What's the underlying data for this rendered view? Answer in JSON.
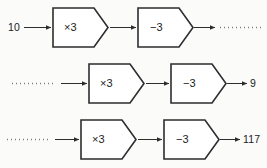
{
  "diagram": {
    "type": "flow-diagram",
    "background_color": "#fbfbfa",
    "shape_stroke_color": "#2d2d2d",
    "shape_fill_color": "#ffffff",
    "arrow_color": "#2d2d2d",
    "dotted_color": "#7d7d7d",
    "text_color": "#1b1b1b",
    "rows": [
      {
        "id": "row-1",
        "input": {
          "kind": "value",
          "text": "10"
        },
        "operations": [
          {
            "id": "op-multiply",
            "label": "×3"
          },
          {
            "id": "op-subtract",
            "label": "−3"
          }
        ],
        "output": {
          "kind": "unknown",
          "text": ""
        }
      },
      {
        "id": "row-2",
        "input": {
          "kind": "unknown",
          "text": ""
        },
        "operations": [
          {
            "id": "op-multiply",
            "label": "×3"
          },
          {
            "id": "op-subtract",
            "label": "−3"
          }
        ],
        "output": {
          "kind": "value",
          "text": "9"
        }
      },
      {
        "id": "row-3",
        "input": {
          "kind": "unknown",
          "text": ""
        },
        "operations": [
          {
            "id": "op-multiply",
            "label": "×3"
          },
          {
            "id": "op-subtract",
            "label": "−3"
          }
        ],
        "output": {
          "kind": "value",
          "text": "117"
        }
      }
    ]
  }
}
